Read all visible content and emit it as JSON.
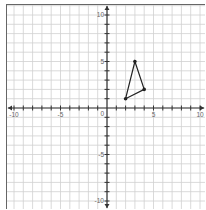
{
  "chart_data": {
    "type": "scatter",
    "title": "",
    "xlabel": "",
    "ylabel": "",
    "xlim": [
      -10,
      10
    ],
    "ylim": [
      -10,
      10
    ],
    "grid": true,
    "x_ticks": [
      -10,
      -5,
      0,
      5,
      10
    ],
    "y_ticks": [
      -10,
      -5,
      5,
      10
    ],
    "x_tick_labels": [
      "-10",
      "-5",
      "0",
      "5",
      "10"
    ],
    "y_tick_labels": [
      "-10",
      "-5",
      "5",
      "10"
    ],
    "origin_label": "0",
    "series": [
      {
        "name": "triangle",
        "shape": "polygon",
        "closed": true,
        "points": [
          [
            2,
            1
          ],
          [
            3,
            5
          ],
          [
            4,
            2
          ]
        ]
      }
    ]
  },
  "colors": {
    "grid": "#d0d0d0",
    "axis": "#333333",
    "shape": "#222222",
    "border": "#666666",
    "label": "#666666"
  }
}
